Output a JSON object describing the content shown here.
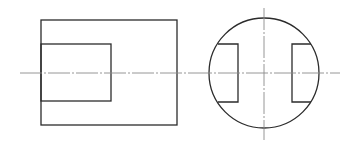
{
  "drawing": {
    "type": "orthographic-projection",
    "colors": {
      "outline": "#2b2b2b",
      "centerline": "#8a8a8a",
      "background": "#ffffff"
    },
    "front_view": {
      "outer_rect": {
        "x": 41,
        "y": 20,
        "width": 136,
        "height": 105
      },
      "inner_rect": {
        "x": 41,
        "y": 44,
        "width": 70,
        "height": 57
      },
      "centerline_h": {
        "x1": 20,
        "y1": 73,
        "x2": 190,
        "y2": 73
      }
    },
    "side_view": {
      "circle": {
        "cx": 264,
        "cy": 73,
        "r": 55
      },
      "left_notch": {
        "x_outer": 218,
        "x_inner": 238,
        "y_top": 44,
        "y_bottom": 102
      },
      "right_notch": {
        "x_inner": 292,
        "x_outer": 311,
        "y_top": 44,
        "y_bottom": 102
      },
      "centerline_h": {
        "x1": 190,
        "y1": 73,
        "x2": 340,
        "y2": 73
      },
      "centerline_v": {
        "x1": 264,
        "y1": 8,
        "x2": 264,
        "y2": 140
      }
    }
  }
}
